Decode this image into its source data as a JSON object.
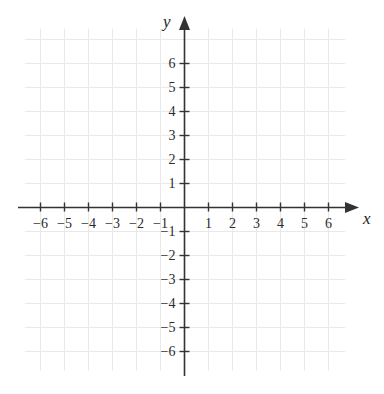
{
  "chart_data": {
    "type": "scatter",
    "title": "",
    "subtitle": "",
    "xlabel": "x",
    "ylabel": "y",
    "xlim": [
      -6.9,
      7.2
    ],
    "ylim": [
      -7.0,
      7.7
    ],
    "xticks": [
      -6,
      -5,
      -4,
      -3,
      -2,
      -1,
      1,
      2,
      3,
      4,
      5,
      6
    ],
    "yticks": [
      6,
      5,
      4,
      3,
      2,
      1,
      -1,
      -2,
      -3,
      -4,
      -5,
      -6
    ],
    "xtick_labels": [
      "−6",
      "−5",
      "−4",
      "−3",
      "−2",
      "−1",
      "1",
      "2",
      "3",
      "4",
      "5",
      "6"
    ],
    "ytick_labels": [
      "6",
      "5",
      "4",
      "3",
      "2",
      "1",
      "−1",
      "−2",
      "−3",
      "−4",
      "−5",
      "−6"
    ],
    "grid": true,
    "grid_spacing_units": 1,
    "legend": null,
    "series": [],
    "values": [],
    "annotations": [],
    "origin_label": "",
    "x_axis_arrow": true,
    "y_axis_arrow": true
  },
  "figure": {
    "x_axis_label": "x",
    "y_axis_label": "y",
    "axis_color": "#333333",
    "grid_color": "#e9e9ec",
    "background_color": "#ffffff",
    "label_color": "#2a2a2a"
  },
  "x_labels": [
    {
      "text": "−6",
      "value": -6
    },
    {
      "text": "−5",
      "value": -5
    },
    {
      "text": "−4",
      "value": -4
    },
    {
      "text": "−3",
      "value": -3
    },
    {
      "text": "−2",
      "value": -2
    },
    {
      "text": "−1",
      "value": -1
    },
    {
      "text": "1",
      "value": 1
    },
    {
      "text": "2",
      "value": 2
    },
    {
      "text": "3",
      "value": 3
    },
    {
      "text": "4",
      "value": 4
    },
    {
      "text": "5",
      "value": 5
    },
    {
      "text": "6",
      "value": 6
    }
  ],
  "y_labels": [
    {
      "text": "6",
      "value": 6
    },
    {
      "text": "5",
      "value": 5
    },
    {
      "text": "4",
      "value": 4
    },
    {
      "text": "3",
      "value": 3
    },
    {
      "text": "2",
      "value": 2
    },
    {
      "text": "1",
      "value": 1
    },
    {
      "text": "−1",
      "value": -1
    },
    {
      "text": "−2",
      "value": -2
    },
    {
      "text": "−3",
      "value": -3
    },
    {
      "text": "−4",
      "value": -4
    },
    {
      "text": "−5",
      "value": -5
    },
    {
      "text": "−6",
      "value": -6
    }
  ]
}
